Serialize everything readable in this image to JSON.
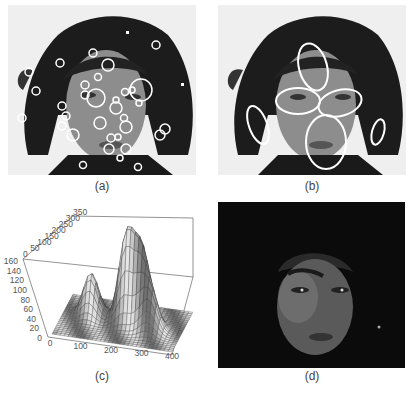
{
  "figure": {
    "panels": [
      {
        "id": "a",
        "caption": "(a)",
        "description": "Grayscale portrait with small circular keypoint detections overlaid"
      },
      {
        "id": "b",
        "caption": "(b)",
        "description": "Grayscale portrait with elliptical region detections (forehead, eyes, nose-mouth, ears)"
      },
      {
        "id": "c",
        "caption": "(c)",
        "description": "3D surface plot of detection density"
      },
      {
        "id": "d",
        "caption": "(d)",
        "description": "Dark-masked portrait highlighting face region"
      }
    ]
  },
  "chart_data": {
    "type": "surface",
    "title": "",
    "x_ticks": [
      "0",
      "100",
      "200",
      "300",
      "400"
    ],
    "y_ticks": [
      "0",
      "50",
      "100",
      "150",
      "200",
      "250",
      "300",
      "350"
    ],
    "z_ticks": [
      "0",
      "20",
      "40",
      "60",
      "80",
      "100",
      "120",
      "140",
      "160"
    ],
    "x_range": [
      0,
      400
    ],
    "y_range": [
      0,
      350
    ],
    "z_range": [
      0,
      160
    ],
    "peaks": [
      {
        "x": 210,
        "y": 200,
        "z": 160
      },
      {
        "x": 260,
        "y": 200,
        "z": 135
      },
      {
        "x": 300,
        "y": 150,
        "z": 80
      },
      {
        "x": 90,
        "y": 210,
        "z": 90
      }
    ],
    "grid": false
  },
  "colors": {
    "overlay": "#ffffff",
    "hair": "#1a1a1a",
    "skin": "#8a8a8a",
    "background": "#f2f2f2",
    "dark_panel": "#0a0a0a"
  }
}
